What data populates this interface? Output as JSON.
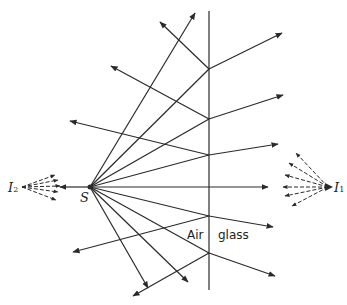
{
  "labels": {
    "source": "S",
    "image_left": {
      "main": "I",
      "sub": "2"
    },
    "image_right": {
      "main": "I",
      "sub": "1"
    },
    "medium_left": "Air",
    "medium_right": "glass"
  },
  "geometry": {
    "source_point": [
      90,
      187
    ],
    "interface_x": 209,
    "interface_y_range": [
      11,
      290
    ],
    "incidence_points_y": [
      69,
      119,
      155,
      187,
      216,
      253
    ],
    "colors": {
      "line": "#2a2a2a",
      "background": "#ffffff"
    }
  }
}
